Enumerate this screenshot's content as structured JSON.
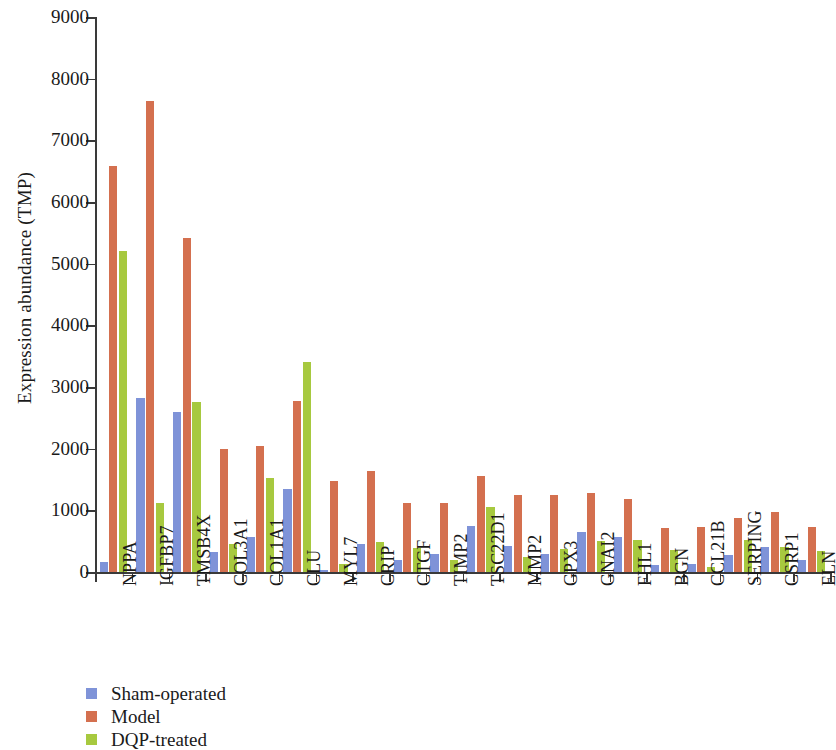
{
  "chart_data": {
    "type": "bar",
    "title": "",
    "xlabel": "",
    "ylabel": "Expression abundance (TMP)",
    "ylim": [
      0,
      9000
    ],
    "ytick_labels": [
      "0",
      "1000",
      "2000",
      "3000",
      "4000",
      "5000",
      "6000",
      "7000",
      "8000",
      "9000"
    ],
    "yticks": [
      0,
      1000,
      2000,
      3000,
      4000,
      5000,
      6000,
      7000,
      8000,
      9000
    ],
    "grid": false,
    "legend_position": "bottom-left",
    "categories": [
      "NPPA",
      "IGFBP7",
      "TMSB4X",
      "COL3A1",
      "COL1A1",
      "CLU",
      "MYL7",
      "CRIP",
      "CTGF",
      "TIMP2",
      "TSC22D1",
      "MMP2",
      "GPX3",
      "GNAI2",
      "FHL1",
      "BGN",
      "CCL21B",
      "SERPING",
      "CSRP1",
      "ELN"
    ],
    "series": [
      {
        "name": "Sham-operated",
        "color": "#7f93d8",
        "values": [
          160,
          2820,
          2590,
          320,
          570,
          1340,
          30,
          460,
          200,
          290,
          750,
          420,
          300,
          650,
          570,
          110,
          130,
          280,
          400,
          200
        ]
      },
      {
        "name": "Model",
        "color": "#d4704f",
        "values": [
          6590,
          7640,
          5420,
          1990,
          2040,
          2780,
          1470,
          1640,
          1120,
          1120,
          1550,
          1250,
          1250,
          1280,
          1190,
          710,
          730,
          880,
          970,
          730
        ]
      },
      {
        "name": "DQP-treated",
        "color": "#a7c93f",
        "values": [
          5210,
          1120,
          2750,
          450,
          1520,
          3410,
          130,
          490,
          390,
          200,
          1060,
          250,
          380,
          510,
          520,
          360,
          80,
          520,
          410,
          340
        ]
      }
    ]
  },
  "legend": {
    "items": [
      {
        "label": "Sham-operated",
        "color": "#7f93d8",
        "key": "sham"
      },
      {
        "label": "Model",
        "color": "#d4704f",
        "key": "model"
      },
      {
        "label": "DQP-treated",
        "color": "#a7c93f",
        "key": "dqp"
      }
    ]
  }
}
